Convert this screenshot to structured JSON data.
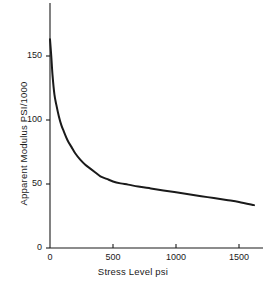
{
  "chart_data": {
    "type": "line",
    "title": "",
    "xlabel": "Stress Level psi",
    "ylabel": "Apparent Modulus PSI/1000",
    "xlim": [
      0,
      1700
    ],
    "ylim": [
      0,
      175
    ],
    "grid": false,
    "legend": null,
    "xticks": [
      {
        "value": 0,
        "label": "0"
      },
      {
        "value": 500,
        "label": "500"
      },
      {
        "value": 1000,
        "label": "1000"
      },
      {
        "value": 1500,
        "label": "1500"
      }
    ],
    "yticks": [
      {
        "value": 0,
        "label": "0"
      },
      {
        "value": 50,
        "label": "50"
      },
      {
        "value": 100,
        "label": "100"
      },
      {
        "value": 150,
        "label": "150"
      }
    ],
    "series": [
      {
        "name": "Apparent Modulus vs Stress Level",
        "color": "#1a1a1a",
        "x": [
          0,
          10,
          20,
          35,
          50,
          70,
          90,
          110,
          140,
          170,
          200,
          240,
          280,
          320,
          360,
          400,
          450,
          500,
          560,
          620,
          700,
          800,
          900,
          1000,
          1100,
          1200,
          1300,
          1400,
          1500,
          1620
        ],
        "y": [
          163,
          150,
          135,
          120,
          112,
          103,
          96,
          91,
          84,
          79,
          74,
          69,
          65,
          62,
          59,
          56,
          54,
          52,
          50.5,
          49.5,
          48,
          46.5,
          45,
          43.5,
          42,
          40.5,
          39,
          37.5,
          36,
          33.5
        ]
      }
    ]
  },
  "axis": {
    "line_color": "#1a1a1a",
    "tick_length": 4
  }
}
